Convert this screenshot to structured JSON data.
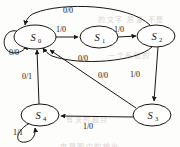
{
  "figure": {
    "type": "state-transition-diagram",
    "label_format": "input/output"
  },
  "states": [
    {
      "id": "S0",
      "name": "S",
      "subscript": "0",
      "cx": 35,
      "cy": 37,
      "rx": 21,
      "ry": 12
    },
    {
      "id": "S1",
      "name": "S",
      "subscript": "1",
      "cx": 99,
      "cy": 37,
      "rx": 19,
      "ry": 11
    },
    {
      "id": "S2",
      "name": "S",
      "subscript": "2",
      "cx": 156,
      "cy": 36,
      "rx": 19,
      "ry": 11
    },
    {
      "id": "S3",
      "name": "S",
      "subscript": "3",
      "cx": 152,
      "cy": 115,
      "rx": 19,
      "ry": 11
    },
    {
      "id": "S4",
      "name": "S",
      "subscript": "4",
      "cx": 40,
      "cy": 115,
      "rx": 19,
      "ry": 11
    }
  ],
  "transitions": [
    {
      "id": "t-s0-self",
      "from": "S0",
      "to": "S0",
      "label": "0/0",
      "lx": 14,
      "ly": 55
    },
    {
      "id": "t-s0-s1",
      "from": "S0",
      "to": "S1",
      "label": "1/0",
      "lx": 61,
      "ly": 32
    },
    {
      "id": "t-s1-s2",
      "from": "S1",
      "to": "S2",
      "label": "1/0",
      "lx": 119,
      "ly": 32
    },
    {
      "id": "t-s2-s0-top",
      "from": "S2",
      "to": "S0",
      "label": "0/0",
      "lx": 68,
      "ly": 13
    },
    {
      "id": "t-s2-s0-mid",
      "from": "S2",
      "to": "S0",
      "label": "0/0",
      "lx": 83,
      "ly": 61
    },
    {
      "id": "t-s2-s3",
      "from": "S2",
      "to": "S3",
      "label": "1/0",
      "lx": 135,
      "ly": 77
    },
    {
      "id": "t-s3-s0",
      "from": "S3",
      "to": "S0",
      "label": "0/0",
      "lx": 103,
      "ly": 78
    },
    {
      "id": "t-s3-s4",
      "from": "S3",
      "to": "S4",
      "label": "1/0",
      "lx": 88,
      "ly": 129
    },
    {
      "id": "t-s4-s0",
      "from": "S4",
      "to": "S0",
      "label": "0/1",
      "lx": 27,
      "ly": 79
    },
    {
      "id": "t-s4-self",
      "from": "S4",
      "to": "S4",
      "label": "1/1",
      "lx": 18,
      "ly": 135
    }
  ],
  "background_bleed": [
    {
      "text": "的文字 质量 不是",
      "x": 98,
      "y": 14
    },
    {
      "text": "一个系统的",
      "x": 108,
      "y": 50
    },
    {
      "text": "有关的题目",
      "x": 66,
      "y": 114
    },
    {
      "text": "电路图中的输出",
      "x": 60,
      "y": 141
    }
  ],
  "colors": {
    "stroke": "#1a1715",
    "paper": "#fdfdfb",
    "bleed": "#cfc9c4"
  }
}
